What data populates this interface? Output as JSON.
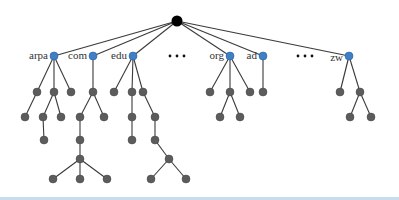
{
  "diagram": {
    "colors": {
      "root": "#000000",
      "tld": "#3f7fc7",
      "node": "#5c5c5c",
      "edge": "#3a3a3a"
    },
    "root": {
      "x": 177,
      "y": 21
    },
    "tlds": [
      {
        "label": "arpa",
        "x": 54,
        "y": 56
      },
      {
        "label": "com",
        "x": 93,
        "y": 56
      },
      {
        "label": "edu",
        "x": 133,
        "y": 56
      },
      {
        "label": "org",
        "x": 230,
        "y": 56
      },
      {
        "label": "ad",
        "x": 263,
        "y": 56
      },
      {
        "label": "zw",
        "x": 349,
        "y": 56
      }
    ],
    "ellipses": [
      {
        "label": "• • •",
        "x": 177,
        "y": 56
      },
      {
        "label": "• • •",
        "x": 305,
        "y": 56
      }
    ],
    "nodes": [
      {
        "id": "a1",
        "x": 37,
        "y": 92,
        "parent": "arpa"
      },
      {
        "id": "a2",
        "x": 54,
        "y": 92,
        "parent": "arpa"
      },
      {
        "id": "a3",
        "x": 71,
        "y": 92,
        "parent": "arpa"
      },
      {
        "id": "a11",
        "x": 25,
        "y": 117,
        "parent": "a1"
      },
      {
        "id": "a21",
        "x": 43,
        "y": 117,
        "parent": "a2"
      },
      {
        "id": "a22",
        "x": 61,
        "y": 117,
        "parent": "a2"
      },
      {
        "id": "a211",
        "x": 44,
        "y": 140,
        "parent": "a21"
      },
      {
        "id": "c1",
        "x": 93,
        "y": 92,
        "parent": "com"
      },
      {
        "id": "c11",
        "x": 80,
        "y": 117,
        "parent": "c1"
      },
      {
        "id": "c12",
        "x": 104,
        "y": 117,
        "parent": "c1"
      },
      {
        "id": "c111",
        "x": 80,
        "y": 140,
        "parent": "c11"
      },
      {
        "id": "c1111",
        "x": 80,
        "y": 159,
        "parent": "c111"
      },
      {
        "id": "c11111",
        "x": 53,
        "y": 179,
        "parent": "c1111"
      },
      {
        "id": "c11112",
        "x": 80,
        "y": 179,
        "parent": "c1111"
      },
      {
        "id": "c11113",
        "x": 107,
        "y": 179,
        "parent": "c1111"
      },
      {
        "id": "e1",
        "x": 114,
        "y": 92,
        "parent": "edu"
      },
      {
        "id": "e2",
        "x": 132,
        "y": 92,
        "parent": "edu"
      },
      {
        "id": "e3",
        "x": 143,
        "y": 92,
        "parent": "edu"
      },
      {
        "id": "e21",
        "x": 132,
        "y": 117,
        "parent": "e2"
      },
      {
        "id": "e211",
        "x": 132,
        "y": 140,
        "parent": "e21"
      },
      {
        "id": "e31",
        "x": 155,
        "y": 117,
        "parent": "e3"
      },
      {
        "id": "e311",
        "x": 155,
        "y": 140,
        "parent": "e31"
      },
      {
        "id": "e3111",
        "x": 169,
        "y": 159,
        "parent": "e311"
      },
      {
        "id": "e31111",
        "x": 151,
        "y": 179,
        "parent": "e3111"
      },
      {
        "id": "e31112",
        "x": 186,
        "y": 179,
        "parent": "e3111"
      },
      {
        "id": "o1",
        "x": 210,
        "y": 92,
        "parent": "org"
      },
      {
        "id": "o2",
        "x": 230,
        "y": 92,
        "parent": "org"
      },
      {
        "id": "o3",
        "x": 250,
        "y": 92,
        "parent": "org"
      },
      {
        "id": "o21",
        "x": 220,
        "y": 117,
        "parent": "o2"
      },
      {
        "id": "o22",
        "x": 240,
        "y": 117,
        "parent": "o2"
      },
      {
        "id": "d1",
        "x": 263,
        "y": 92,
        "parent": "ad"
      },
      {
        "id": "z1",
        "x": 340,
        "y": 92,
        "parent": "zw"
      },
      {
        "id": "z2",
        "x": 360,
        "y": 92,
        "parent": "zw"
      },
      {
        "id": "z21",
        "x": 350,
        "y": 117,
        "parent": "z2"
      },
      {
        "id": "z22",
        "x": 371,
        "y": 117,
        "parent": "z2"
      }
    ]
  }
}
